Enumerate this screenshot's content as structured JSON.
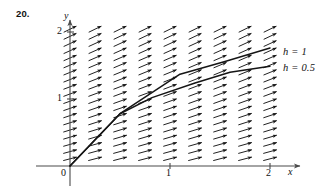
{
  "figure": {
    "problem_number": "20.",
    "axes": {
      "x_axis_label": "x",
      "y_axis_label": "y",
      "origin_label": "0",
      "x_ticks": [
        {
          "value": 1,
          "label": "1",
          "px": 170
        },
        {
          "value": 2,
          "label": "2",
          "px": 270
        }
      ],
      "y_ticks": [
        {
          "value": 1,
          "label": "1",
          "px": 99
        },
        {
          "value": 2,
          "label": "2",
          "px": 32
        }
      ],
      "x_range": [
        0,
        2.15
      ],
      "y_range": [
        0,
        2.15
      ],
      "origin_px": {
        "x": 70,
        "y": 166
      },
      "unit_px": {
        "x": 100,
        "y": 67
      }
    },
    "legend": {
      "position": "right",
      "entries": [
        {
          "name": "curve-h-1",
          "label": "h = 1"
        },
        {
          "name": "curve-h-05",
          "label": "h = 0.5"
        }
      ]
    },
    "ink_color": "#151515",
    "axis_color": "#4a4a4a"
  },
  "chart_data": {
    "type": "line",
    "title": "",
    "subtitle": "",
    "xlabel": "x",
    "ylabel": "y",
    "xlim": [
      0,
      2.15
    ],
    "ylim": [
      0,
      2.15
    ],
    "xticks": [
      0,
      1,
      2
    ],
    "yticks": [
      1,
      2
    ],
    "grid": false,
    "legend_position": "right",
    "slope_field": {
      "description": "direction field of arrows pointing right and slightly upward",
      "marker": "arrow",
      "x_values": [
        0,
        0.25,
        0.5,
        0.75,
        1.0,
        1.25,
        1.5,
        1.75,
        2.0
      ],
      "y_values": [
        0,
        0.107,
        0.215,
        0.322,
        0.43,
        0.537,
        0.645,
        0.752,
        0.86,
        0.967,
        1.075,
        1.182,
        1.29,
        1.397,
        1.505,
        1.612,
        1.72,
        1.827,
        1.935,
        2.042
      ],
      "columns": 9,
      "rows": 20,
      "arrow_length_px": 14,
      "slope_angle_deg_range": [
        14,
        26
      ]
    },
    "series": [
      {
        "name": "h = 1",
        "style": "piecewise-linear",
        "points": [
          {
            "x": 0.0,
            "y": 0.0
          },
          {
            "x": 0.5,
            "y": 0.78
          },
          {
            "x": 1.1,
            "y": 1.37
          },
          {
            "x": 1.55,
            "y": 1.56
          },
          {
            "x": 2.0,
            "y": 1.76
          }
        ]
      },
      {
        "name": "h = 0.5",
        "style": "piecewise-linear",
        "points": [
          {
            "x": 0.0,
            "y": 0.0
          },
          {
            "x": 0.5,
            "y": 0.78
          },
          {
            "x": 0.82,
            "y": 1.02
          },
          {
            "x": 1.25,
            "y": 1.24
          },
          {
            "x": 1.6,
            "y": 1.4
          },
          {
            "x": 2.0,
            "y": 1.49
          }
        ]
      }
    ]
  }
}
